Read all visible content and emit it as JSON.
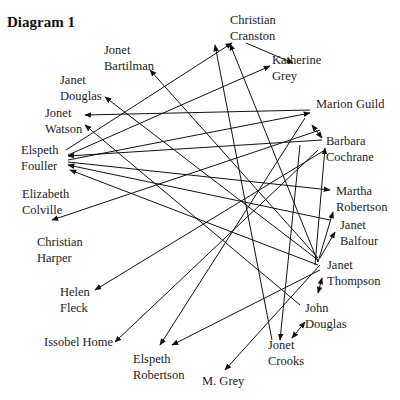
{
  "title": "Diagram 1",
  "nodes": [
    {
      "id": "christian_cranston",
      "label": "Christian\nCranston",
      "x": 230,
      "y": 12
    },
    {
      "id": "katherine_grey",
      "label": "Katherine\nGrey",
      "x": 272,
      "y": 52
    },
    {
      "id": "marion_guild",
      "label": "Marion Guild",
      "x": 316,
      "y": 96
    },
    {
      "id": "barbara_cochrane",
      "label": "Barbara\nCochrane",
      "x": 326,
      "y": 133
    },
    {
      "id": "martha_robertson",
      "label": "Martha\nRobertson",
      "x": 336,
      "y": 183
    },
    {
      "id": "janet_balfour",
      "label": "Janet\nBalfour",
      "x": 340,
      "y": 217
    },
    {
      "id": "janet_thompson",
      "label": "Janet\nThompson",
      "x": 327,
      "y": 257
    },
    {
      "id": "john_douglas",
      "label": "John\nDouglas",
      "x": 305,
      "y": 300
    },
    {
      "id": "jonet_crooks",
      "label": "Jonet\nCrooks",
      "x": 268,
      "y": 337
    },
    {
      "id": "m_grey",
      "label": "M. Grey",
      "x": 202,
      "y": 373
    },
    {
      "id": "elspeth_robertson",
      "label": "Elspeth\nRobertson",
      "x": 133,
      "y": 351
    },
    {
      "id": "issobel_home",
      "label": "Issobel Home",
      "x": 44,
      "y": 334
    },
    {
      "id": "helen_fleck",
      "label": "Helen\nFleck",
      "x": 60,
      "y": 284
    },
    {
      "id": "christian_harper",
      "label": "Christian\nHarper",
      "x": 37,
      "y": 234
    },
    {
      "id": "elizabeth_colville",
      "label": "Elizabeth\nColville",
      "x": 22,
      "y": 186
    },
    {
      "id": "elspeth_fouller",
      "label": "Elspeth\nFouller",
      "x": 21,
      "y": 142
    },
    {
      "id": "jonet_watson",
      "label": "Jonet\nWatson",
      "x": 45,
      "y": 105
    },
    {
      "id": "janet_douglas",
      "label": "Janet\nDouglas",
      "x": 60,
      "y": 72
    },
    {
      "id": "jonet_bartilman",
      "label": "Jonet\nBartilman",
      "x": 104,
      "y": 42
    }
  ],
  "edges": [
    {
      "from": [
        66,
        150
      ],
      "to": [
        232,
        43
      ]
    },
    {
      "from": [
        246,
        43
      ],
      "to": [
        293,
        63
      ]
    },
    {
      "from": [
        68,
        155
      ],
      "to": [
        270,
        66
      ]
    },
    {
      "from": [
        68,
        160
      ],
      "to": [
        310,
        113
      ]
    },
    {
      "from": [
        310,
        110
      ],
      "to": [
        85,
        115
      ]
    },
    {
      "from": [
        320,
        130
      ],
      "to": [
        52,
        220
      ]
    },
    {
      "from": [
        322,
        140
      ],
      "to": [
        68,
        156
      ]
    },
    {
      "from": [
        325,
        150
      ],
      "to": [
        95,
        290
      ]
    },
    {
      "from": [
        318,
        150
      ],
      "to": [
        115,
        342
      ]
    },
    {
      "from": [
        305,
        118
      ],
      "to": [
        160,
        345
      ]
    },
    {
      "from": [
        68,
        162
      ],
      "to": [
        330,
        190
      ]
    },
    {
      "from": [
        330,
        220
      ],
      "to": [
        68,
        165
      ]
    },
    {
      "from": [
        318,
        265
      ],
      "to": [
        70,
        170
      ]
    },
    {
      "from": [
        300,
        305
      ],
      "to": [
        85,
        125
      ]
    },
    {
      "from": [
        318,
        260
      ],
      "to": [
        105,
        97
      ]
    },
    {
      "from": [
        318,
        258
      ],
      "to": [
        150,
        70
      ]
    },
    {
      "from": [
        318,
        262
      ],
      "to": [
        230,
        44
      ]
    },
    {
      "from": [
        272,
        340
      ],
      "to": [
        215,
        45
      ]
    },
    {
      "from": [
        300,
        145
      ],
      "to": [
        280,
        340
      ]
    },
    {
      "from": [
        320,
        265
      ],
      "to": [
        225,
        370
      ]
    },
    {
      "from": [
        320,
        270
      ],
      "to": [
        172,
        345
      ]
    },
    {
      "from": [
        315,
        265
      ],
      "to": [
        325,
        148
      ]
    },
    {
      "from": [
        318,
        262
      ],
      "to": [
        333,
        212
      ]
    },
    {
      "from": [
        320,
        258
      ],
      "to": [
        335,
        232
      ]
    },
    {
      "from": [
        0,
        0
      ],
      "to": [
        0,
        0
      ],
      "note": "placeholder"
    }
  ],
  "bidirectional": [
    {
      "a": [
        312,
        125
      ],
      "b": [
        322,
        138
      ]
    },
    {
      "a": [
        322,
        278
      ],
      "b": [
        318,
        293
      ]
    },
    {
      "a": [
        292,
        338
      ],
      "b": [
        305,
        322
      ]
    }
  ]
}
